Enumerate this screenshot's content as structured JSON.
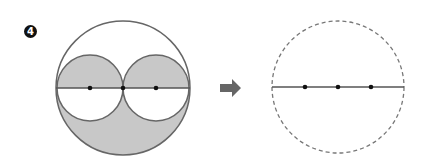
{
  "problem": {
    "number": "4"
  },
  "diagram": {
    "colors": {
      "stroke": "#666666",
      "fill": "#c8c8c8",
      "dot": "#111111",
      "arrow": "#666666",
      "dashed": "#777777"
    },
    "left_figure": {
      "big_circle": {
        "cx": 123,
        "cy": 88,
        "r": 67
      },
      "small_circles": [
        {
          "cx": 90,
          "cy": 88,
          "r": 33
        },
        {
          "cx": 156,
          "cy": 88,
          "r": 33
        }
      ],
      "dots": [
        {
          "x": 90,
          "y": 88
        },
        {
          "x": 123,
          "y": 88
        },
        {
          "x": 156,
          "y": 88
        }
      ]
    },
    "arrow": {
      "direction": "right"
    },
    "right_figure": {
      "dashed_circle": {
        "cx": 338,
        "cy": 87,
        "r": 66
      },
      "dots": [
        {
          "x": 305,
          "y": 87
        },
        {
          "x": 338,
          "y": 87
        },
        {
          "x": 371,
          "y": 87
        }
      ]
    }
  }
}
